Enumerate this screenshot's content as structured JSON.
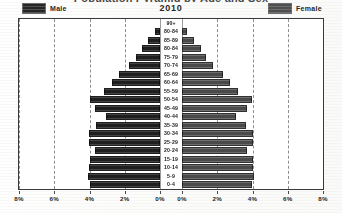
{
  "chart_data": {
    "type": "bar",
    "subtype": "population-pyramid",
    "title": "Population Pyramid by Age and Sex",
    "year_label": "2010",
    "xlabel": "",
    "ylabel": "",
    "grid": true,
    "legend_position": "top",
    "xlim_left": [
      8,
      0
    ],
    "xlim_right": [
      0,
      8
    ],
    "xtick_labels_left": [
      "8%",
      "6%",
      "4%",
      "2%",
      "0%"
    ],
    "xtick_labels_right": [
      "0%",
      "2%",
      "4%",
      "6%",
      "8%"
    ],
    "xtick_values": [
      8,
      6,
      4,
      2,
      0,
      0,
      2,
      4,
      6,
      8
    ],
    "categories": [
      "90+",
      "80-84",
      "85-89",
      "80-84",
      "75-79",
      "70-74",
      "65-69",
      "60-64",
      "55-59",
      "50-54",
      "45-49",
      "40-44",
      "35-39",
      "30-34",
      "25-29",
      "20-24",
      "15-19",
      "10-14",
      "5-9",
      "0-4"
    ],
    "series": [
      {
        "name": "Male",
        "color": "#1f1f1f",
        "values": [
          0.0,
          0.3,
          0.7,
          1.05,
          1.35,
          1.75,
          2.35,
          2.75,
          3.15,
          3.95,
          3.7,
          3.05,
          3.65,
          4.05,
          4.05,
          3.7,
          4.0,
          4.05,
          4.1,
          3.95
        ]
      },
      {
        "name": "Female",
        "color": "#4a4a4a",
        "values": [
          0.0,
          0.3,
          0.7,
          1.05,
          1.35,
          1.75,
          2.35,
          2.75,
          3.15,
          3.95,
          3.7,
          3.05,
          3.65,
          4.05,
          4.05,
          3.7,
          4.0,
          4.05,
          4.1,
          3.95
        ]
      }
    ]
  },
  "legend": {
    "male_label": "Male",
    "female_label": "Female",
    "male_swatch_icon": "male-color-swatch",
    "female_swatch_icon": "female-color-swatch"
  },
  "colors": {
    "male": "#1f1f1f",
    "female": "#4a4a4a",
    "grid": "#8e8e8e",
    "frame": "#3a3a3a",
    "background": "#ffffff"
  }
}
